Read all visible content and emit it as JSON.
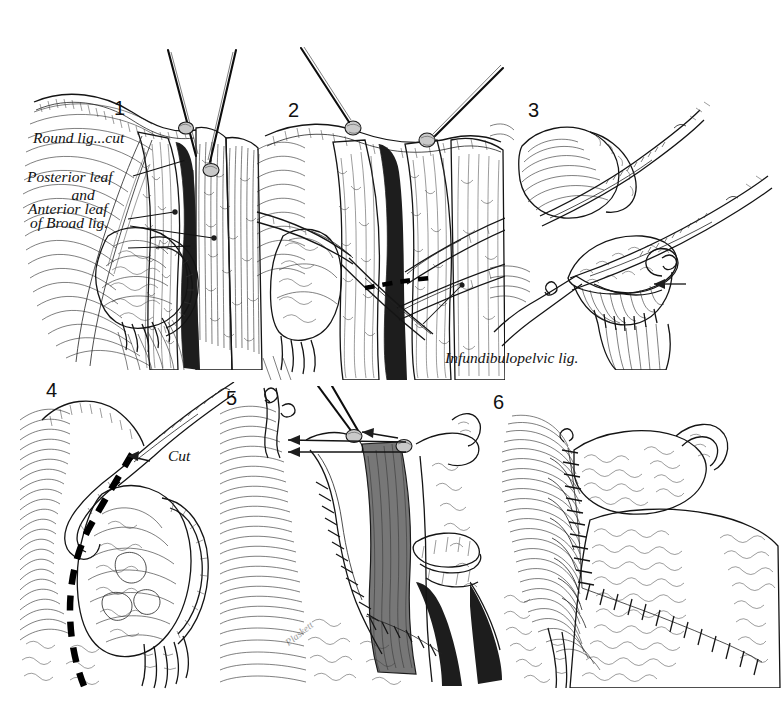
{
  "plate": {
    "title": "Six-step surgical technique plate",
    "subject": "Broad ligament dissection and salpingo-oophorectomy",
    "background_color": "#ffffff",
    "ink_color": "#1b1b1b",
    "width": 784,
    "height": 726,
    "artist_signature": "Plaskett"
  },
  "panels": [
    {
      "number": "1",
      "caption": "Round ligament divided; posterior and anterior leaves of broad ligament exposed",
      "labels": [
        {
          "id": "round-lig",
          "text": "Round lig...cut"
        },
        {
          "id": "posterior-leaf",
          "text": "Posterior leaf"
        },
        {
          "id": "and",
          "text": "and"
        },
        {
          "id": "anterior-leaf",
          "text": "Anterior leaf"
        },
        {
          "id": "of-broad-lig",
          "text": "of Broad lig."
        }
      ]
    },
    {
      "number": "2",
      "caption": "Clamps applied across the infundibulopelvic ligament; dashed line marks incision",
      "labels": [
        {
          "id": "infundibulopelvic",
          "text": "Infundibulopelvic lig."
        }
      ]
    },
    {
      "number": "3",
      "caption": "Pedicle doubly clamped and transfixion suture ligature placed",
      "labels": []
    },
    {
      "number": "4",
      "caption": "Line of incision outlined on the broad ligament",
      "labels": [
        {
          "id": "cut",
          "text": "Cut"
        }
      ]
    },
    {
      "number": "5",
      "caption": "Continuous suture closing the peritoneal leaves",
      "labels": []
    },
    {
      "number": "6",
      "caption": "Completed peritonealization",
      "labels": []
    }
  ]
}
